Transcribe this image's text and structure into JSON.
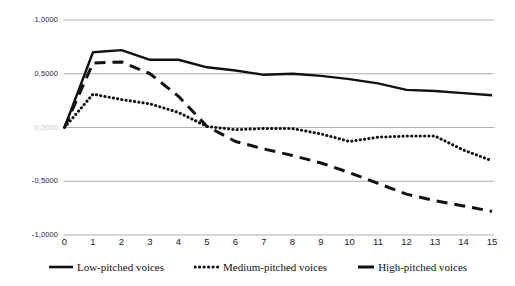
{
  "chart_data": {
    "type": "line",
    "title": "",
    "subtitle": "",
    "xlabel": "",
    "ylabel": "",
    "xlim": [
      0,
      15
    ],
    "ylim": [
      -1.0,
      1.0
    ],
    "grid": true,
    "grid_axis": "y",
    "legend_position": "bottom",
    "decimal_separator": ",",
    "x": [
      0,
      1,
      2,
      3,
      4,
      5,
      6,
      7,
      8,
      9,
      10,
      11,
      12,
      13,
      14,
      15
    ],
    "categories": [
      "0",
      "1",
      "2",
      "3",
      "4",
      "5",
      "6",
      "7",
      "8",
      "9",
      "10",
      "11",
      "12",
      "13",
      "14",
      "15"
    ],
    "y_ticks": [
      -1.0,
      -0.5,
      0.0,
      0.5,
      1.0
    ],
    "y_tick_labels": [
      "-1,0000",
      "-0,5000",
      "0,0000",
      "0,5000",
      "1,0000"
    ],
    "series": [
      {
        "name": "Low-pitched voices",
        "style": "solid",
        "color": "#111111",
        "values": [
          0.0,
          0.7,
          0.72,
          0.63,
          0.63,
          0.56,
          0.53,
          0.49,
          0.5,
          0.48,
          0.45,
          0.41,
          0.35,
          0.34,
          0.32,
          0.3
        ]
      },
      {
        "name": "Medium-pitched voices",
        "style": "dotted",
        "color": "#111111",
        "values": [
          0.0,
          0.31,
          0.26,
          0.22,
          0.14,
          0.01,
          -0.02,
          -0.01,
          -0.01,
          -0.06,
          -0.13,
          -0.09,
          -0.08,
          -0.08,
          -0.21,
          -0.31
        ]
      },
      {
        "name": "High-pitched voices",
        "style": "dashed",
        "color": "#111111",
        "values": [
          0.0,
          0.6,
          0.61,
          0.5,
          0.29,
          0.01,
          -0.13,
          -0.2,
          -0.26,
          -0.33,
          -0.42,
          -0.52,
          -0.62,
          -0.68,
          -0.73,
          -0.78
        ]
      }
    ]
  },
  "legend": {
    "items": [
      {
        "label": "Low-pitched voices",
        "style": "solid"
      },
      {
        "label": "Medium-pitched voices",
        "style": "dotted"
      },
      {
        "label": "High-pitched voices",
        "style": "dashed"
      }
    ]
  },
  "axes": {
    "y_labels": [
      "1,0000",
      "0,5000",
      "0,0000",
      "-0,5000",
      "-1,0000"
    ],
    "x_labels": [
      "0",
      "1",
      "2",
      "3",
      "4",
      "5",
      "6",
      "7",
      "8",
      "9",
      "10",
      "11",
      "12",
      "13",
      "14",
      "15"
    ]
  },
  "colors": {
    "line": "#111111",
    "gridline": "#a6a6a6",
    "axis_text": "#222222",
    "background": "#ffffff"
  }
}
